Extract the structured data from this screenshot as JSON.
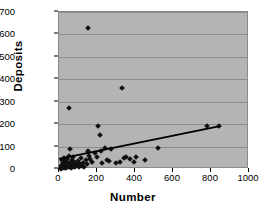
{
  "chart_data": {
    "type": "scatter",
    "title": "",
    "xlabel": "Number",
    "ylabel": "Deposits",
    "xlim": [
      0,
      1000
    ],
    "ylim": [
      0,
      700
    ],
    "xticks": [
      0,
      200,
      400,
      600,
      800,
      1000
    ],
    "yticks": [
      0,
      100,
      200,
      300,
      400,
      500,
      600,
      700
    ],
    "grid": "horizontal",
    "legend": "none",
    "plot_background": "#b4b4b4",
    "marker_color": "#111111",
    "marker_shape": "diamond",
    "points": [
      [
        8,
        5
      ],
      [
        10,
        12
      ],
      [
        12,
        2
      ],
      [
        14,
        20
      ],
      [
        15,
        40
      ],
      [
        18,
        8
      ],
      [
        20,
        30
      ],
      [
        22,
        15
      ],
      [
        24,
        50
      ],
      [
        25,
        3
      ],
      [
        28,
        22
      ],
      [
        30,
        10
      ],
      [
        32,
        36
      ],
      [
        35,
        6
      ],
      [
        38,
        18
      ],
      [
        40,
        28
      ],
      [
        42,
        45
      ],
      [
        45,
        9
      ],
      [
        48,
        14
      ],
      [
        50,
        270
      ],
      [
        52,
        25
      ],
      [
        55,
        60
      ],
      [
        58,
        12
      ],
      [
        60,
        88
      ],
      [
        62,
        33
      ],
      [
        65,
        5
      ],
      [
        68,
        17
      ],
      [
        70,
        42
      ],
      [
        72,
        8
      ],
      [
        75,
        55
      ],
      [
        78,
        20
      ],
      [
        80,
        30
      ],
      [
        85,
        11
      ],
      [
        90,
        26
      ],
      [
        95,
        16
      ],
      [
        100,
        35
      ],
      [
        105,
        7
      ],
      [
        110,
        21
      ],
      [
        115,
        48
      ],
      [
        120,
        13
      ],
      [
        125,
        28
      ],
      [
        130,
        9
      ],
      [
        140,
        38
      ],
      [
        145,
        24
      ],
      [
        150,
        630
      ],
      [
        152,
        82
      ],
      [
        155,
        75
      ],
      [
        160,
        60
      ],
      [
        165,
        45
      ],
      [
        175,
        30
      ],
      [
        190,
        70
      ],
      [
        200,
        55
      ],
      [
        205,
        193
      ],
      [
        215,
        152
      ],
      [
        220,
        80
      ],
      [
        225,
        28
      ],
      [
        240,
        92
      ],
      [
        255,
        40
      ],
      [
        265,
        35
      ],
      [
        275,
        90
      ],
      [
        300,
        25
      ],
      [
        320,
        30
      ],
      [
        330,
        360
      ],
      [
        340,
        50
      ],
      [
        350,
        55
      ],
      [
        375,
        45
      ],
      [
        395,
        30
      ],
      [
        405,
        52
      ],
      [
        450,
        40
      ],
      [
        520,
        95
      ],
      [
        780,
        190
      ],
      [
        840,
        190
      ]
    ],
    "trendline": {
      "x_start": 0,
      "y_start": 45,
      "x_end": 840,
      "y_end": 190,
      "color": "#000000"
    }
  }
}
